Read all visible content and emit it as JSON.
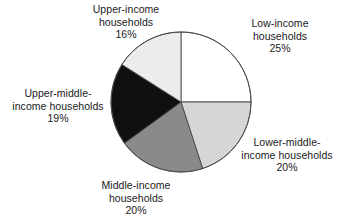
{
  "chart_data": {
    "type": "pie",
    "title": "",
    "subtitle": "",
    "xlabel": "",
    "ylabel": "",
    "legend_position": "none",
    "grid": false,
    "labels_outside": true,
    "start_angle_deg": 0,
    "direction": "clockwise",
    "categories": [
      "Low-income households",
      "Lower-middle-income households",
      "Middle-income households",
      "Upper-middle-income households",
      "Upper-income households"
    ],
    "values": [
      25,
      20,
      20,
      19,
      16
    ],
    "value_labels": [
      "25%",
      "20%",
      "20%",
      "19%",
      "16%"
    ],
    "units": "percent",
    "total": 100,
    "colors": [
      "#ffffff",
      "#d6d6d6",
      "#8a8a8a",
      "#101010",
      "#ececec"
    ],
    "slices": [
      {
        "name": "low-income",
        "category": "Low-income households",
        "value": 25,
        "value_label": "25%",
        "color": "#ffffff",
        "start_deg": 0,
        "end_deg": 90,
        "label_lines": [
          "Low-income",
          "households"
        ]
      },
      {
        "name": "lower-middle-income",
        "category": "Lower-middle-income households",
        "value": 20,
        "value_label": "20%",
        "color": "#d6d6d6",
        "start_deg": 90,
        "end_deg": 162,
        "label_lines": [
          "Lower-middle-",
          "income households"
        ]
      },
      {
        "name": "middle-income",
        "category": "Middle-income households",
        "value": 20,
        "value_label": "20%",
        "color": "#8a8a8a",
        "start_deg": 162,
        "end_deg": 234,
        "label_lines": [
          "Middle-income",
          "households"
        ]
      },
      {
        "name": "upper-middle-income",
        "category": "Upper-middle-income households",
        "value": 19,
        "value_label": "19%",
        "color": "#101010",
        "start_deg": 234,
        "end_deg": 302.4,
        "label_lines": [
          "Upper-middle-",
          "income households"
        ]
      },
      {
        "name": "upper-income",
        "category": "Upper-income households",
        "value": 16,
        "value_label": "16%",
        "color": "#ececec",
        "start_deg": 302.4,
        "end_deg": 360,
        "label_lines": [
          "Upper-income",
          "households"
        ]
      }
    ]
  },
  "labels": {
    "upper_income": {
      "line1": "Upper-income",
      "line2": "households",
      "pct": "16%"
    },
    "low_income": {
      "line1": "Low-income",
      "line2": "households",
      "pct": "25%"
    },
    "lower_middle_income": {
      "line1": "Lower-middle-",
      "line2": "income households",
      "pct": "20%"
    },
    "middle_income": {
      "line1": "Middle-income",
      "line2": "households",
      "pct": "20%"
    },
    "upper_middle_income": {
      "line1": "Upper-middle-",
      "line2": "income households",
      "pct": "19%"
    }
  },
  "style": {
    "outline_color": "#4a4a4a",
    "text_color": "#1a1a1a",
    "background": "#ffffff"
  }
}
